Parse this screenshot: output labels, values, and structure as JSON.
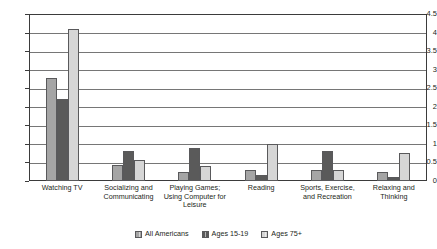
{
  "chart_data": {
    "type": "bar",
    "title": "",
    "xlabel": "",
    "ylabel": "",
    "ylim": [
      0,
      4.5
    ],
    "ytick_labels": [
      "4.5",
      "4",
      "3.5",
      "3",
      "2.5",
      "2",
      "1.5",
      "1",
      "0.5",
      "0"
    ],
    "ytick_values": [
      4.5,
      4,
      3.5,
      3,
      2.5,
      2,
      1.5,
      1,
      0.5,
      0
    ],
    "grid": true,
    "legend_position": "bottom",
    "categories": [
      "Watching TV",
      "Socializing and Communicating",
      "Playing Games; Using Computer for Leisure",
      "Reading",
      "Sports, Exercise, and Recreation",
      "Relaxing and Thinking"
    ],
    "series": [
      {
        "name": "All Americans",
        "color": "#a5a5a5",
        "values": [
          2.78,
          0.42,
          0.25,
          0.3,
          0.3,
          0.25
        ]
      },
      {
        "name": "Ages 15-19",
        "color": "#5a5a5a",
        "values": [
          2.2,
          0.82,
          0.9,
          0.15,
          0.8,
          0.12
        ]
      },
      {
        "name": "Ages 75+",
        "color": "#d6d6d6",
        "values": [
          4.1,
          0.57,
          0.4,
          1.0,
          0.3,
          0.75
        ]
      }
    ]
  },
  "legend": {
    "items": [
      {
        "label": "All Americans",
        "color": "#a5a5a5"
      },
      {
        "label": "Ages 15-19",
        "color": "#5a5a5a"
      },
      {
        "label": "Ages 75+",
        "color": "#d6d6d6"
      }
    ]
  }
}
